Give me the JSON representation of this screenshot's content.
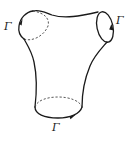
{
  "figure": {
    "labels": {
      "top_left": "Γ",
      "top_right": "Γ",
      "bottom": "Γ"
    },
    "colors": {
      "stroke": "#1a1a1a",
      "background": "#ffffff"
    }
  }
}
